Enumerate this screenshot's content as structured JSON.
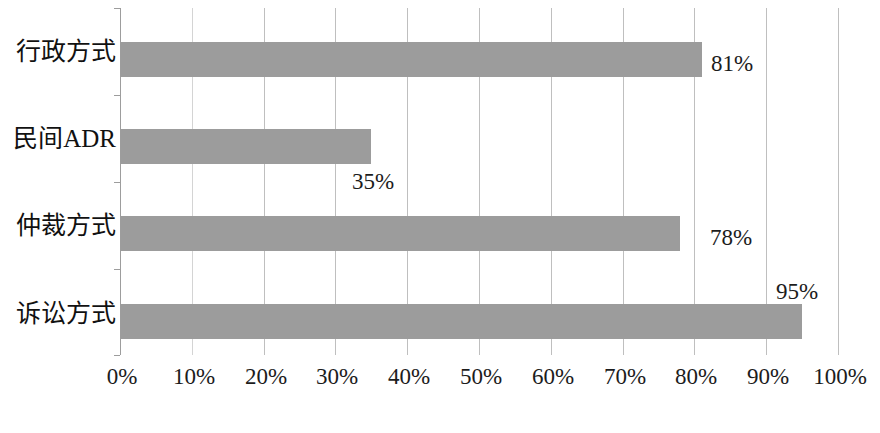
{
  "chart_data": {
    "type": "bar",
    "orientation": "horizontal",
    "title": "",
    "subtitle": "",
    "xlabel": "",
    "ylabel": "",
    "categories": [
      "诉讼方式",
      "仲裁方式",
      "民间ADR",
      "行政方式"
    ],
    "values": [
      95,
      78,
      35,
      81
    ],
    "value_labels": [
      "95%",
      "78%",
      "35%",
      "81%"
    ],
    "display_order_top_to_bottom": [
      "行政方式",
      "民间ADR",
      "仲裁方式",
      "诉讼方式"
    ],
    "values_top_to_bottom": [
      81,
      35,
      78,
      95
    ],
    "xlim": [
      0,
      100
    ],
    "xticks": [
      0,
      10,
      20,
      30,
      40,
      50,
      60,
      70,
      80,
      90,
      100
    ],
    "xtick_labels": [
      "0%",
      "10%",
      "20%",
      "30%",
      "40%",
      "50%",
      "60%",
      "70%",
      "80%",
      "90%",
      "100%"
    ],
    "grid": "vertical",
    "legend": "none",
    "bar_color": "#9c9c9c",
    "gridline_color": "#bfbfbf",
    "axis_color": "#9d9d9d",
    "text_color": "#1c1c1c",
    "background": "#ffffff"
  },
  "bars": [
    {
      "label": "行政方式",
      "value": 81,
      "value_label": "81%",
      "label_position": "right-of-bar"
    },
    {
      "label": "民间ADR",
      "value": 35,
      "value_label": "35%",
      "label_position": "below-right-of-bar"
    },
    {
      "label": "仲裁方式",
      "value": 78,
      "value_label": "78%",
      "label_position": "right-of-bar"
    },
    {
      "label": "诉讼方式",
      "value": 95,
      "value_label": "95%",
      "label_position": "above-right-of-bar"
    }
  ],
  "axis": {
    "x_tick_labels": [
      "0%",
      "10%",
      "20%",
      "30%",
      "40%",
      "50%",
      "60%",
      "70%",
      "80%",
      "90%",
      "100%"
    ]
  }
}
